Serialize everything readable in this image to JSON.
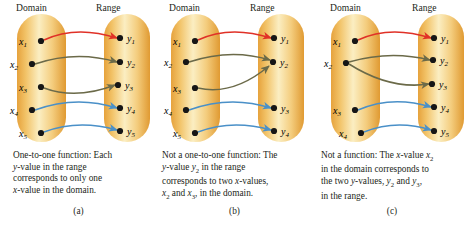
{
  "figure": {
    "panels": [
      {
        "id": "a",
        "label": "(a)",
        "domain_header": "Domain",
        "range_header": "Range",
        "domain_items": [
          "x1",
          "x2",
          "x3",
          "x4",
          "x5"
        ],
        "range_items": [
          "y1",
          "y2",
          "y3",
          "y4",
          "y5"
        ],
        "caption": "One-to-one function: Each y-value in the range corresponds to only one x-value in the domain.",
        "caption_lines": [
          "One-to-one function: Each",
          "y-value in the range",
          "corresponds to only one",
          "x-value in the domain."
        ],
        "mappings": [
          {
            "from": "x1",
            "to": "y1",
            "color": "#e03127"
          },
          {
            "from": "x2",
            "to": "y2",
            "color": "#6b6a49"
          },
          {
            "from": "x3",
            "to": "y3",
            "color": "#6b6a49"
          },
          {
            "from": "x4",
            "to": "y4",
            "color": "#4a90c8"
          },
          {
            "from": "x5",
            "to": "y5",
            "color": "#4a90c8"
          }
        ]
      },
      {
        "id": "b",
        "label": "(b)",
        "domain_header": "Domain",
        "range_header": "Range",
        "domain_items": [
          "x1",
          "x2",
          "x3",
          "x4",
          "x5"
        ],
        "range_items": [
          "y1",
          "y2",
          "y3",
          "y4"
        ],
        "caption": "Not a one-to-one function: The y-value y2 in the range corresponds to two x-values, x2 and x3, in the domain.",
        "caption_lines": [
          "Not a one-to-one function: The",
          "y-value y2 in the range",
          "corresponds to two x-values,",
          "x2 and x3, in the domain."
        ],
        "mappings": [
          {
            "from": "x1",
            "to": "y1",
            "color": "#e03127"
          },
          {
            "from": "x2",
            "to": "y2",
            "color": "#6b6a49"
          },
          {
            "from": "x3",
            "to": "y2",
            "color": "#6b6a49"
          },
          {
            "from": "x4",
            "to": "y3",
            "color": "#4a90c8"
          },
          {
            "from": "x5",
            "to": "y4",
            "color": "#4a90c8"
          }
        ]
      },
      {
        "id": "c",
        "label": "(c)",
        "domain_header": "Domain",
        "range_header": "Range",
        "domain_items": [
          "x1",
          "x2",
          "x3",
          "x4"
        ],
        "range_items": [
          "y1",
          "y2",
          "y3",
          "y4",
          "y5"
        ],
        "caption": "Not a function: The x-value x2 in the domain corresponds to the two y-values, y2 and y3, in the range.",
        "caption_lines": [
          "Not a function: The x-value x2",
          "in the domain corresponds to",
          "the two y-values, y2 and y3,",
          "in the range."
        ],
        "mappings": [
          {
            "from": "x1",
            "to": "y1",
            "color": "#e03127"
          },
          {
            "from": "x2",
            "to": "y2",
            "color": "#6b6a49"
          },
          {
            "from": "x2",
            "to": "y3",
            "color": "#6b6a49"
          },
          {
            "from": "x3",
            "to": "y4",
            "color": "#4a90c8"
          },
          {
            "from": "x4",
            "to": "y5",
            "color": "#4a90c8"
          }
        ]
      }
    ],
    "colors": {
      "capsule_center": "#fdf3d0",
      "capsule_edge": "#e9a93f",
      "arrow_red": "#e03127",
      "arrow_olive": "#6b6a49",
      "arrow_blue": "#4a90c8",
      "dot": "#1a1a1a",
      "background": "#ffffff",
      "text": "#231f20"
    }
  }
}
